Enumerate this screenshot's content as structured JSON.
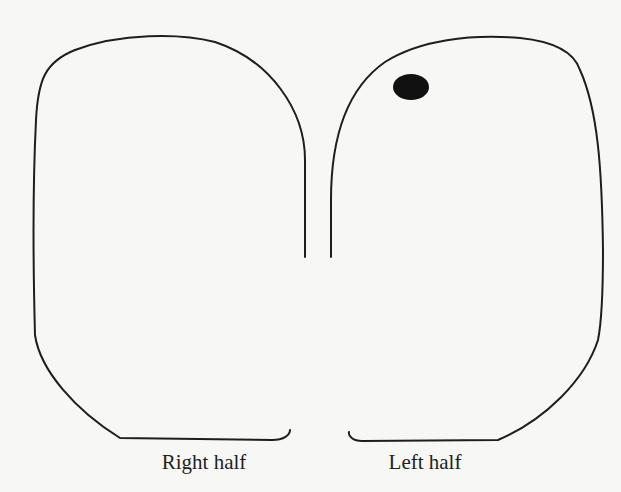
{
  "diagram": {
    "type": "brain-hemispheres-top-view",
    "labels": {
      "right_half": "Right half",
      "left_half": "Left half"
    },
    "colors": {
      "background": "#f7f7f5",
      "outline": "#1e1e1e",
      "dot": "#111111"
    },
    "marker": {
      "description": "filled oval dot near top of left half",
      "cx": 411,
      "cy": 87,
      "rx": 18,
      "ry": 13
    }
  }
}
